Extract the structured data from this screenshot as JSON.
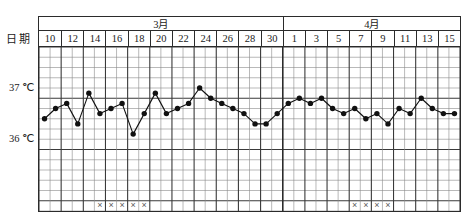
{
  "topstrip": {
    "text": ""
  },
  "axis": {
    "row_label": "日期",
    "y_ticks": [
      {
        "label": "37 ℃",
        "value": 37
      },
      {
        "label": "36 ℃",
        "value": 36
      }
    ]
  },
  "header": {
    "months": [
      {
        "label": "3月",
        "span_dates": 11
      },
      {
        "label": "4月",
        "span_dates": 8
      }
    ],
    "dates": [
      "10",
      "12",
      "14",
      "16",
      "18",
      "20",
      "22",
      "24",
      "26",
      "28",
      "30",
      "1",
      "3",
      "5",
      "7",
      "9",
      "11",
      "13",
      "15"
    ]
  },
  "chart_data": {
    "type": "line",
    "title": "",
    "xlabel": "日期",
    "ylabel": "℃",
    "ylim": [
      35.5,
      37.5
    ],
    "y_gridline_step": 0.1,
    "grid": true,
    "legend": "none",
    "marker": "filled-circle",
    "x_columns": 38,
    "categories": [
      "10",
      "",
      "12",
      "",
      "14",
      "",
      "16",
      "",
      "18",
      "",
      "20",
      "",
      "22",
      "",
      "24",
      "",
      "26",
      "",
      "28",
      "",
      "30",
      "",
      "1",
      "",
      "3",
      "",
      "5",
      "",
      "7",
      "",
      "9",
      "",
      "11",
      "",
      "13",
      "",
      "15",
      ""
    ],
    "values": [
      36.0,
      36.2,
      36.3,
      35.9,
      36.5,
      36.1,
      36.2,
      36.3,
      35.7,
      36.1,
      36.5,
      36.1,
      36.2,
      36.3,
      36.6,
      36.4,
      36.3,
      36.2,
      36.1,
      35.9,
      35.9,
      36.1,
      36.3,
      36.4,
      36.3,
      36.4,
      36.2,
      36.1,
      36.2,
      36.0,
      36.1,
      35.9,
      36.2,
      36.1,
      36.4,
      36.2,
      36.1,
      36.1
    ],
    "annotations": {
      "symbol": "×",
      "row": "bottom",
      "groups": [
        {
          "start_column": 5,
          "count": 5
        },
        {
          "start_column": 28,
          "count": 4
        }
      ]
    }
  },
  "colors": {
    "ink": "#1b1b1b",
    "grid_minor": "#8a8a8a",
    "grid_major": "#3a3a3a",
    "frame": "#2b2b2b",
    "series": "#111111",
    "page_bg": "#ffffff"
  }
}
